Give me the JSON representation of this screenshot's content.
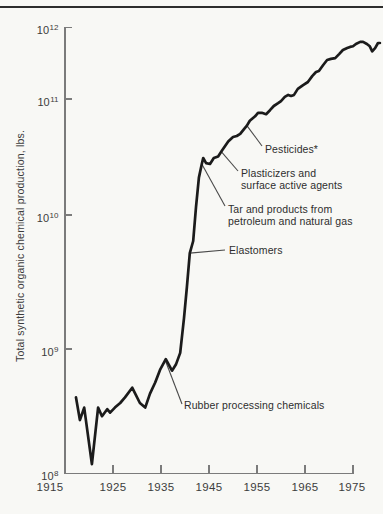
{
  "chart_data": {
    "type": "line",
    "title": "",
    "xlabel": "",
    "ylabel": "Total synthetic organic chemical production, lbs.",
    "y_scale": "log",
    "ylim": [
      100000000.0,
      1000000000000.0
    ],
    "xlim": [
      1915,
      1975
    ],
    "grid": false,
    "x_tick_labels": [
      "1915",
      "1925",
      "1935",
      "1945",
      "1955",
      "1965",
      "1975"
    ],
    "y_tick_labels": [
      "10^12",
      "10^11",
      "10^10",
      "10^9",
      "10^8"
    ],
    "line_color": "#1b1b1b",
    "series": [
      {
        "name": "Total synthetic organic chemical production",
        "points": [
          [
            1917.3,
            410000000.0
          ],
          [
            1918.1,
            270000000.0
          ],
          [
            1919.0,
            340000000.0
          ],
          [
            1920.6,
            120000000.0
          ],
          [
            1921.9,
            340000000.0
          ],
          [
            1922.7,
            290000000.0
          ],
          [
            1923.8,
            330000000.0
          ],
          [
            1924.4,
            310000000.0
          ],
          [
            1925.4,
            340000000.0
          ],
          [
            1926.5,
            370000000.0
          ],
          [
            1927.5,
            410000000.0
          ],
          [
            1929.0,
            490000000.0
          ],
          [
            1930.6,
            370000000.0
          ],
          [
            1931.7,
            340000000.0
          ],
          [
            1932.7,
            440000000.0
          ],
          [
            1933.8,
            540000000.0
          ],
          [
            1934.8,
            680000000.0
          ],
          [
            1936.0,
            830000000.0
          ],
          [
            1937.3,
            670000000.0
          ],
          [
            1938.1,
            750000000.0
          ],
          [
            1939.0,
            930000000.0
          ],
          [
            1939.8,
            1700000000.0
          ],
          [
            1940.4,
            2900000000.0
          ],
          [
            1941.0,
            5200000000.0
          ],
          [
            1941.7,
            6400000000.0
          ],
          [
            1942.3,
            11700000000.0
          ],
          [
            1942.9,
            21000000000.0
          ],
          [
            1943.5,
            27500000000.0
          ],
          [
            1943.8,
            31000000000.0
          ],
          [
            1944.4,
            28000000000.0
          ],
          [
            1945.2,
            27500000000.0
          ],
          [
            1946.0,
            31000000000.0
          ],
          [
            1946.9,
            32000000000.0
          ],
          [
            1947.7,
            36000000000.0
          ],
          [
            1949.0,
            43000000000.0
          ],
          [
            1950.0,
            47000000000.0
          ],
          [
            1950.8,
            48000000000.0
          ],
          [
            1951.5,
            50000000000.0
          ],
          [
            1952.3,
            55000000000.0
          ],
          [
            1952.9,
            59000000000.0
          ],
          [
            1953.5,
            65000000000.0
          ],
          [
            1954.6,
            71000000000.0
          ],
          [
            1955.2,
            76000000000.0
          ],
          [
            1956.0,
            76000000000.0
          ],
          [
            1956.9,
            74000000000.0
          ],
          [
            1957.7,
            80000000000.0
          ],
          [
            1958.5,
            87000000000.0
          ],
          [
            1959.4,
            92000000000.0
          ],
          [
            1960.0,
            96000000000.0
          ],
          [
            1960.8,
            107000000000.0
          ],
          [
            1961.5,
            114000000000.0
          ],
          [
            1962.1,
            110000000000.0
          ],
          [
            1962.7,
            114000000000.0
          ],
          [
            1963.5,
            138000000000.0
          ],
          [
            1964.6,
            156000000000.0
          ],
          [
            1965.6,
            172000000000.0
          ],
          [
            1966.5,
            208000000000.0
          ],
          [
            1967.3,
            237000000000.0
          ],
          [
            1967.9,
            245000000000.0
          ],
          [
            1968.8,
            297000000000.0
          ],
          [
            1969.6,
            348000000000.0
          ],
          [
            1970.4,
            360000000000.0
          ],
          [
            1971.3,
            370000000000.0
          ],
          [
            1972.1,
            420000000000.0
          ],
          [
            1972.9,
            480000000000.0
          ],
          [
            1973.8,
            510000000000.0
          ],
          [
            1974.4,
            530000000000.0
          ],
          [
            1975.0,
            540000000000.0
          ],
          [
            1975.6,
            580000000000.0
          ],
          [
            1976.5,
            620000000000.0
          ],
          [
            1977.1,
            620000000000.0
          ],
          [
            1977.9,
            580000000000.0
          ],
          [
            1978.5,
            540000000000.0
          ],
          [
            1979.0,
            460000000000.0
          ],
          [
            1979.6,
            510000000000.0
          ],
          [
            1980.2,
            600000000000.0
          ],
          [
            1980.6,
            600000000000.0
          ]
        ]
      }
    ],
    "annotations": [
      {
        "label": "Pesticides*",
        "year": 1952.9,
        "value": 59000000000.0
      },
      {
        "label": "Plasticizers and\nsurface active agents",
        "year": 1947.6,
        "value": 35000000000.0
      },
      {
        "label": "Tar and products from\npetroleum and natural gas",
        "year": 1943.5,
        "value": 27500000000.0
      },
      {
        "label": "Elastomers",
        "year": 1941.0,
        "value": 5200000000.0
      },
      {
        "label": "Rubber processing chemicals",
        "year": 1936.0,
        "value": 790000000.0
      }
    ]
  }
}
